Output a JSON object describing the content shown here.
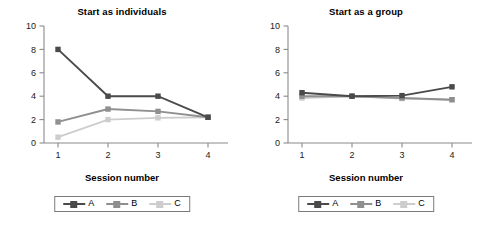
{
  "figure": {
    "width": 488,
    "height": 234,
    "background": "#ffffff"
  },
  "series_colors": {
    "A": "#4a4a4a",
    "B": "#8f8f8f",
    "C": "#cdcdcd"
  },
  "legend": {
    "entries": [
      {
        "key": "A",
        "label": "A",
        "color": "#4a4a4a"
      },
      {
        "key": "B",
        "label": "B",
        "color": "#8f8f8f"
      },
      {
        "key": "C",
        "label": "C",
        "color": "#cdcdcd"
      }
    ]
  },
  "axis": {
    "xlabel": "Session number",
    "x_ticks": [
      "1",
      "2",
      "3",
      "4"
    ],
    "y_ticks": [
      "0",
      "2",
      "4",
      "6",
      "8",
      "10"
    ]
  },
  "chart_data": [
    {
      "type": "line",
      "title": "Start as individuals",
      "xlabel": "Session number",
      "ylabel": "",
      "x": [
        1,
        2,
        3,
        4
      ],
      "categories": [
        "1",
        "2",
        "3",
        "4"
      ],
      "xlim": [
        0.6,
        4.4
      ],
      "ylim": [
        0,
        10
      ],
      "yticks": [
        0,
        2,
        4,
        6,
        8,
        10
      ],
      "xticks": [
        1,
        2,
        3,
        4
      ],
      "grid": false,
      "legend_position": "below",
      "marker": "square",
      "series": [
        {
          "name": "A",
          "color": "#4a4a4a",
          "values": [
            8.0,
            4.0,
            4.0,
            2.2
          ]
        },
        {
          "name": "B",
          "color": "#8f8f8f",
          "values": [
            1.8,
            2.9,
            2.7,
            2.2
          ]
        },
        {
          "name": "C",
          "color": "#cdcdcd",
          "values": [
            0.5,
            2.0,
            2.15,
            2.2
          ]
        }
      ]
    },
    {
      "type": "line",
      "title": "Start as a group",
      "xlabel": "Session number",
      "ylabel": "",
      "x": [
        1,
        2,
        3,
        4
      ],
      "categories": [
        "1",
        "2",
        "3",
        "4"
      ],
      "xlim": [
        0.6,
        4.4
      ],
      "ylim": [
        0,
        10
      ],
      "yticks": [
        0,
        2,
        4,
        6,
        8,
        10
      ],
      "xticks": [
        1,
        2,
        3,
        4
      ],
      "grid": false,
      "legend_position": "below",
      "marker": "square",
      "series": [
        {
          "name": "A",
          "color": "#4a4a4a",
          "values": [
            4.3,
            4.0,
            4.05,
            4.8
          ]
        },
        {
          "name": "B",
          "color": "#8f8f8f",
          "values": [
            4.0,
            4.0,
            3.85,
            3.7
          ]
        },
        {
          "name": "C",
          "color": "#cdcdcd",
          "values": [
            3.85,
            4.0,
            3.8,
            3.7
          ]
        }
      ]
    }
  ]
}
